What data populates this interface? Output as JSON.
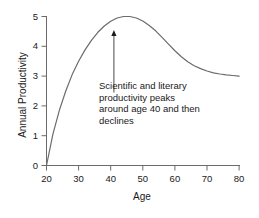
{
  "chart_data": {
    "type": "line",
    "title": "",
    "xlabel": "Age",
    "ylabel": "Annual Productivity",
    "xlim": [
      20,
      80
    ],
    "ylim": [
      0,
      5
    ],
    "xticks": [
      "20",
      "30",
      "40",
      "50",
      "60",
      "70",
      "80"
    ],
    "yticks": [
      "0",
      "1",
      "2",
      "3",
      "4",
      "5"
    ],
    "grid": false,
    "legend": false,
    "line_color": "#6b6b6b",
    "text_color": "#1a1a1a",
    "series": [
      {
        "name": "Annual Productivity",
        "x": [
          20,
          22,
          24,
          26,
          28,
          30,
          32,
          34,
          36,
          38,
          40,
          42,
          44,
          46,
          48,
          50,
          52,
          54,
          56,
          58,
          60,
          62,
          64,
          66,
          68,
          70,
          72,
          74,
          76,
          78,
          80
        ],
        "values": [
          0.0,
          1.05,
          1.85,
          2.5,
          3.05,
          3.5,
          3.88,
          4.2,
          4.47,
          4.68,
          4.84,
          4.95,
          5.0,
          5.0,
          4.95,
          4.85,
          4.7,
          4.52,
          4.3,
          4.07,
          3.85,
          3.65,
          3.48,
          3.35,
          3.25,
          3.17,
          3.11,
          3.07,
          3.04,
          3.02,
          3.0
        ]
      }
    ],
    "annotations": [
      {
        "name": "peak-annotation",
        "lines": [
          "Scientific and literary",
          "productivity peaks",
          "around age 40 and then",
          "declines"
        ],
        "arrow": {
          "from_age": 41,
          "from_value": 2.45,
          "to_age": 41,
          "to_value": 4.55
        }
      }
    ]
  },
  "axes": {
    "ylabel": "Annual Productivity",
    "xlabel": "Age",
    "yticks": [
      "5",
      "4",
      "3",
      "2",
      "1",
      "0"
    ],
    "xticks": [
      "20",
      "30",
      "40",
      "50",
      "60",
      "70",
      "80"
    ]
  },
  "annotation": {
    "line1": "Scientific and literary",
    "line2": "productivity peaks",
    "line3": "around age 40 and then",
    "line4": "declines"
  }
}
